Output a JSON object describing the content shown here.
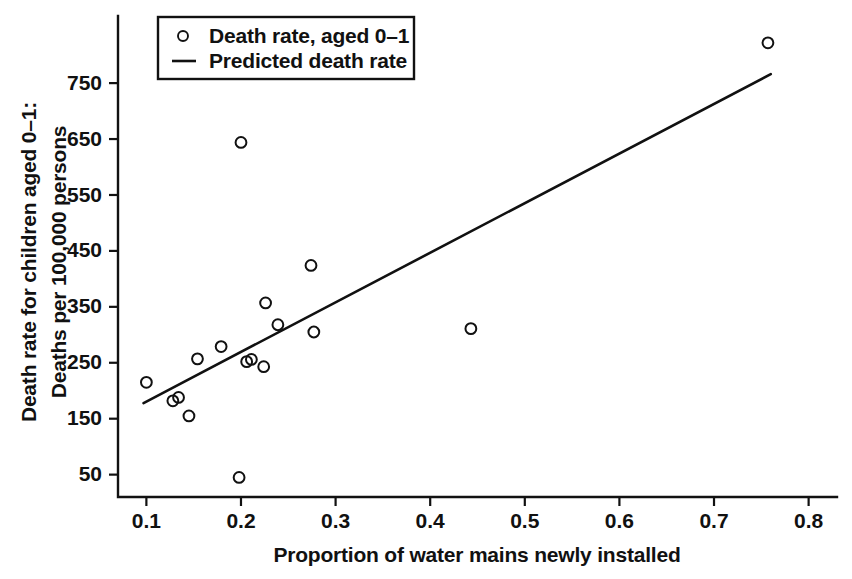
{
  "chart_data": {
    "type": "scatter",
    "title": "",
    "xlabel": "Proportion of water mains newly installed",
    "ylabel_line1": "Death rate for children aged 0–1:",
    "ylabel_line2": "Deaths per 100,000 persons",
    "xlim": [
      0.07,
      0.83
    ],
    "ylim": [
      10,
      870
    ],
    "xticks": [
      0.1,
      0.2,
      0.3,
      0.4,
      0.5,
      0.6,
      0.7,
      0.8
    ],
    "xticklabels": [
      "0.1",
      "0.2",
      "0.3",
      "0.4",
      "0.5",
      "0.6",
      "0.7",
      "0.8"
    ],
    "yticks": [
      50,
      150,
      250,
      350,
      450,
      550,
      650,
      750
    ],
    "yticklabels": [
      "50",
      "150",
      "250",
      "350",
      "450",
      "550",
      "650",
      "750"
    ],
    "grid": false,
    "legend_position": "top-left-inside",
    "legend": [
      {
        "label": "Death rate, aged 0–1",
        "marker": "circle-open"
      },
      {
        "label": "Predicted death rate",
        "marker": "line"
      }
    ],
    "series": [
      {
        "name": "Death rate, aged 0–1",
        "type": "scatter",
        "marker": "circle-open",
        "color": "#111111",
        "points": [
          {
            "x": 0.1,
            "y": 215
          },
          {
            "x": 0.128,
            "y": 182
          },
          {
            "x": 0.134,
            "y": 188
          },
          {
            "x": 0.145,
            "y": 155
          },
          {
            "x": 0.154,
            "y": 257
          },
          {
            "x": 0.179,
            "y": 279
          },
          {
            "x": 0.198,
            "y": 45
          },
          {
            "x": 0.2,
            "y": 644
          },
          {
            "x": 0.206,
            "y": 252
          },
          {
            "x": 0.211,
            "y": 256
          },
          {
            "x": 0.224,
            "y": 243
          },
          {
            "x": 0.226,
            "y": 357
          },
          {
            "x": 0.239,
            "y": 318
          },
          {
            "x": 0.274,
            "y": 424
          },
          {
            "x": 0.277,
            "y": 305
          },
          {
            "x": 0.443,
            "y": 311
          },
          {
            "x": 0.757,
            "y": 822
          }
        ]
      },
      {
        "name": "Predicted death rate",
        "type": "line",
        "color": "#111111",
        "endpoints": [
          {
            "x": 0.097,
            "y": 178
          },
          {
            "x": 0.76,
            "y": 766
          }
        ]
      }
    ]
  },
  "axes": {
    "x_title": "Proportion of water mains newly installed",
    "y_title_line1": "Death rate for children aged 0–1:",
    "y_title_line2": "Deaths per 100,000 persons"
  },
  "legend": {
    "entry_scatter_label": "Death rate, aged 0–1",
    "entry_line_label": "Predicted death rate"
  },
  "colors": {
    "ink": "#111111",
    "background": "#ffffff"
  }
}
